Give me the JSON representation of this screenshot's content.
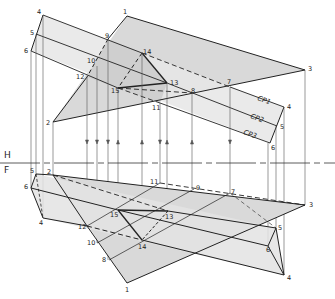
{
  "figure": {
    "type": "descriptive-geometry",
    "fold_line": {
      "top_label": "H",
      "bottom_label": "F",
      "y": 163
    },
    "colors": {
      "line": "#222222",
      "fill": "#d8d8d8",
      "fill_strip": "#e6e6e6",
      "projector": "#555555"
    },
    "cutting_planes": [
      {
        "label": "CP1",
        "x": 257,
        "y": 100,
        "rot": 20
      },
      {
        "label": "CP2",
        "x": 250,
        "y": 118,
        "rot": 20
      },
      {
        "label": "CP3",
        "x": 243,
        "y": 134,
        "rot": 20
      }
    ],
    "top_view": {
      "points": {
        "1": [
          127,
          16
        ],
        "2": [
          53,
          122
        ],
        "3": [
          305,
          70
        ],
        "4": [
          43,
          15
        ],
        "5": [
          36,
          34
        ],
        "6": [
          31,
          51
        ],
        "4r": [
          284,
          107
        ],
        "5r": [
          277,
          126
        ],
        "6r": [
          270,
          143
        ],
        "7": [
          230,
          87
        ],
        "8": [
          192,
          93
        ],
        "9": [
          108,
          39
        ],
        "10": [
          97,
          66
        ],
        "11": [
          160,
          103
        ],
        "12": [
          87,
          77
        ],
        "13": [
          167,
          83
        ],
        "14": [
          142,
          53
        ],
        "15": [
          118,
          88
        ]
      },
      "labels": [
        {
          "t": "1",
          "x": 123,
          "y": 14
        },
        {
          "t": "2",
          "x": 46,
          "y": 125
        },
        {
          "t": "3",
          "x": 308,
          "y": 71
        },
        {
          "t": "4",
          "x": 37,
          "y": 14
        },
        {
          "t": "5",
          "x": 30,
          "y": 35
        },
        {
          "t": "6",
          "x": 24,
          "y": 53
        },
        {
          "t": "4",
          "x": 287,
          "y": 109
        },
        {
          "t": "5",
          "x": 280,
          "y": 129
        },
        {
          "t": "6",
          "x": 271,
          "y": 150
        },
        {
          "t": "7",
          "x": 227,
          "y": 84
        },
        {
          "t": "8",
          "x": 191,
          "y": 93
        },
        {
          "t": "9",
          "x": 105,
          "y": 38
        },
        {
          "t": "10",
          "x": 87,
          "y": 63
        },
        {
          "t": "11",
          "x": 152,
          "y": 110
        },
        {
          "t": "12",
          "x": 76,
          "y": 79
        },
        {
          "t": "13",
          "x": 170,
          "y": 85
        },
        {
          "t": "14",
          "x": 143,
          "y": 54
        },
        {
          "t": "15",
          "x": 111,
          "y": 93
        }
      ]
    },
    "front_view": {
      "points": {
        "1": [
          127,
          283
        ],
        "2": [
          53,
          175
        ],
        "3": [
          305,
          205
        ],
        "4": [
          43,
          218
        ],
        "5": [
          36,
          174
        ],
        "6": [
          31,
          188
        ],
        "4r": [
          284,
          275
        ],
        "5r": [
          276,
          228
        ],
        "6r": [
          268,
          246
        ],
        "7": [
          230,
          193
        ],
        "8": [
          109,
          260
        ],
        "9": [
          194,
          189
        ],
        "10": [
          97,
          243
        ],
        "11": [
          160,
          183
        ],
        "12": [
          87,
          226
        ],
        "13": [
          168,
          211
        ],
        "14": [
          142,
          240
        ],
        "15": [
          118,
          210
        ]
      },
      "labels": [
        {
          "t": "1",
          "x": 125,
          "y": 292
        },
        {
          "t": "2",
          "x": 47,
          "y": 174
        },
        {
          "t": "3",
          "x": 309,
          "y": 207
        },
        {
          "t": "4",
          "x": 39,
          "y": 225
        },
        {
          "t": "5",
          "x": 30,
          "y": 173
        },
        {
          "t": "6",
          "x": 24,
          "y": 189
        },
        {
          "t": "4",
          "x": 287,
          "y": 280
        },
        {
          "t": "5",
          "x": 278,
          "y": 230
        },
        {
          "t": "6",
          "x": 266,
          "y": 252
        },
        {
          "t": "7",
          "x": 231,
          "y": 194
        },
        {
          "t": "8",
          "x": 102,
          "y": 262
        },
        {
          "t": "9",
          "x": 196,
          "y": 190
        },
        {
          "t": "10",
          "x": 87,
          "y": 245
        },
        {
          "t": "11",
          "x": 150,
          "y": 184
        },
        {
          "t": "12",
          "x": 78,
          "y": 229
        },
        {
          "t": "13",
          "x": 165,
          "y": 219
        },
        {
          "t": "14",
          "x": 138,
          "y": 249
        },
        {
          "t": "15",
          "x": 110,
          "y": 217
        }
      ]
    }
  }
}
